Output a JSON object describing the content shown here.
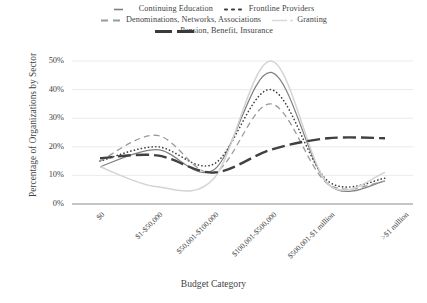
{
  "chart_data": {
    "type": "line",
    "title": "",
    "xlabel": "Budget Category",
    "ylabel": "Percentage of Organizations by Sector",
    "categories": [
      "$0",
      "$1-$50,000",
      "$50,001-$100,000",
      "$100,001-$500,000",
      "$500,001-$1 million",
      ">$1 million"
    ],
    "ylim": [
      0,
      50
    ],
    "yticks": [
      0,
      10,
      20,
      30,
      40,
      50
    ],
    "ytick_labels": [
      "0%",
      "10%",
      "20%",
      "30%",
      "40%",
      "50%"
    ],
    "grid": "horizontal",
    "legend_position": "top",
    "smoothing": "spline",
    "series": [
      {
        "name": "Continuing Education",
        "style": "solid",
        "color": "#808080",
        "width": 1.2,
        "values": [
          13,
          19,
          12,
          46,
          7,
          8
        ]
      },
      {
        "name": "Frontline Providers",
        "style": "dotted",
        "color": "#3f3f3f",
        "width": 1.6,
        "values": [
          15,
          20,
          14,
          40,
          8,
          9
        ]
      },
      {
        "name": "Denominations, Networks, Associations",
        "style": "dashed",
        "color": "#9a9a9a",
        "width": 1.3,
        "values": [
          15,
          24,
          11,
          35,
          7,
          8
        ]
      },
      {
        "name": "Granting",
        "style": "solid-light",
        "color": "#d4d4d4",
        "width": 1.5,
        "values": [
          13,
          6,
          9,
          50,
          7,
          11
        ]
      },
      {
        "name": "Pension, Benefit, Insurance",
        "style": "long-dash",
        "color": "#404040",
        "width": 2.4,
        "values": [
          16,
          17,
          11,
          19,
          23,
          23
        ]
      }
    ]
  },
  "legend": {
    "rows": [
      [
        {
          "label": "Continuing Education",
          "icon": "legend-line-solid-gray"
        },
        {
          "label": "Frontline Providers",
          "icon": "legend-line-dotted-dark"
        }
      ],
      [
        {
          "label": "Denominations, Networks, Associations",
          "icon": "legend-line-dashed-gray"
        },
        {
          "label": "Granting",
          "icon": "legend-line-solid-light"
        }
      ],
      [
        {
          "label": "Pension, Benefit, Insurance",
          "icon": "legend-line-longdash-dark"
        }
      ]
    ]
  },
  "axes": {
    "y_title": "Percentage of Organizations by Sector",
    "x_title": "Budget Category",
    "y_ticks": [
      "50%",
      "40%",
      "30%",
      "20%",
      "10%",
      "0%"
    ],
    "x_ticks": [
      "$0",
      "$1-$50,000",
      "$50,001-$100,000",
      "$100,001-$500,000",
      "$500,001-$1 million",
      ">$1 million"
    ]
  },
  "colors": {
    "axis": "#8c8c8c",
    "grid": "#e8e8e8",
    "text": "#3f3f3f",
    "continuing_education": "#808080",
    "frontline_providers": "#3f3f3f",
    "denominations": "#9a9a9a",
    "granting": "#d4d4d4",
    "pension": "#404040"
  }
}
